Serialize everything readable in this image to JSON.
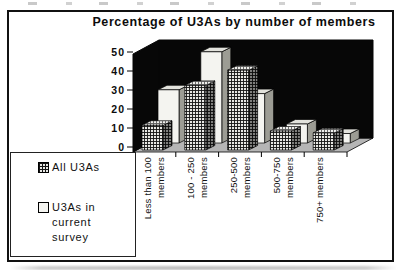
{
  "title": "Percentage of U3As by number of members",
  "legend": {
    "items": [
      {
        "label": "All U3As",
        "swatch": "crosshatch"
      },
      {
        "label": "U3As in current survey",
        "swatch": "plain-white"
      }
    ]
  },
  "chart_data": {
    "type": "bar",
    "style": "3d-column",
    "title": "Percentage of U3As by number of members",
    "categories": [
      "Less than 100 members",
      "100 - 250 members",
      "250-500 members",
      "500-750 members",
      "750+ members"
    ],
    "category_label_lines": [
      [
        "Less than 100",
        "members"
      ],
      [
        "100 - 250",
        "members"
      ],
      [
        "250-500",
        "members"
      ],
      [
        "500-750",
        "members"
      ],
      [
        "750+ members"
      ]
    ],
    "series": [
      {
        "name": "All U3As",
        "pattern": "crosshatch",
        "values": [
          13,
          34,
          42,
          10,
          9
        ]
      },
      {
        "name": "U3As in current survey",
        "pattern": "plain-white",
        "values": [
          28,
          48,
          26,
          10,
          5
        ]
      }
    ],
    "ylim": [
      0,
      50
    ],
    "ytick_step": 10,
    "yticks": [
      0,
      10,
      20,
      30,
      40,
      50
    ],
    "grid": false,
    "legend_position": "bottom-left",
    "colors": {
      "wall": "#070707",
      "floor": "#b5b5b5",
      "bar_plain": "#f4f4f0",
      "bar_plain_side": "#9c9c94",
      "bar_plain_top": "#e2e2dc",
      "hatch_bg": "#e8e8e4",
      "hatch_line": "#141414",
      "axis": "#000000"
    }
  }
}
